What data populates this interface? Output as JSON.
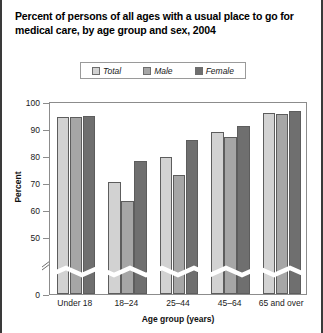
{
  "title": "Percent of persons of all ages with a usual place to go for medical care, by age group and sex, 2004",
  "colors": {
    "total": "#d2d2d2",
    "male": "#a6a6a6",
    "female": "#6f6f6f",
    "axis": "#8c8c8c",
    "text": "#1a1a1a"
  },
  "legend": {
    "items": [
      {
        "label": "Total",
        "color": "#d2d2d2"
      },
      {
        "label": "Male",
        "color": "#a6a6a6"
      },
      {
        "label": "Female",
        "color": "#6f6f6f"
      }
    ]
  },
  "chart_data": {
    "type": "bar",
    "title": "Percent of persons of all ages with a usual place to go for medical care, by age group and sex, 2004",
    "xlabel": "Age group (years)",
    "ylabel": "Percent",
    "categories": [
      "Under 18",
      "18–24",
      "25–44",
      "45–64",
      "65 and over"
    ],
    "series": [
      {
        "name": "Total",
        "values": [
          94.3,
          70.5,
          79.5,
          89.0,
          96.0
        ]
      },
      {
        "name": "Male",
        "values": [
          94.3,
          63.5,
          73.0,
          87.0,
          95.5
        ]
      },
      {
        "name": "Female",
        "values": [
          94.8,
          78.0,
          86.0,
          91.0,
          96.5
        ]
      }
    ],
    "ylim": [
      0,
      100
    ],
    "yticks": [
      0,
      50,
      60,
      70,
      80,
      90,
      100
    ],
    "ytick_labels": [
      "0",
      "50",
      "60",
      "70",
      "80",
      "90",
      "100"
    ],
    "axis_break": true,
    "axis_break_note": "y-axis broken between 0 and 50",
    "grid": false,
    "legend_position": "top-center"
  }
}
